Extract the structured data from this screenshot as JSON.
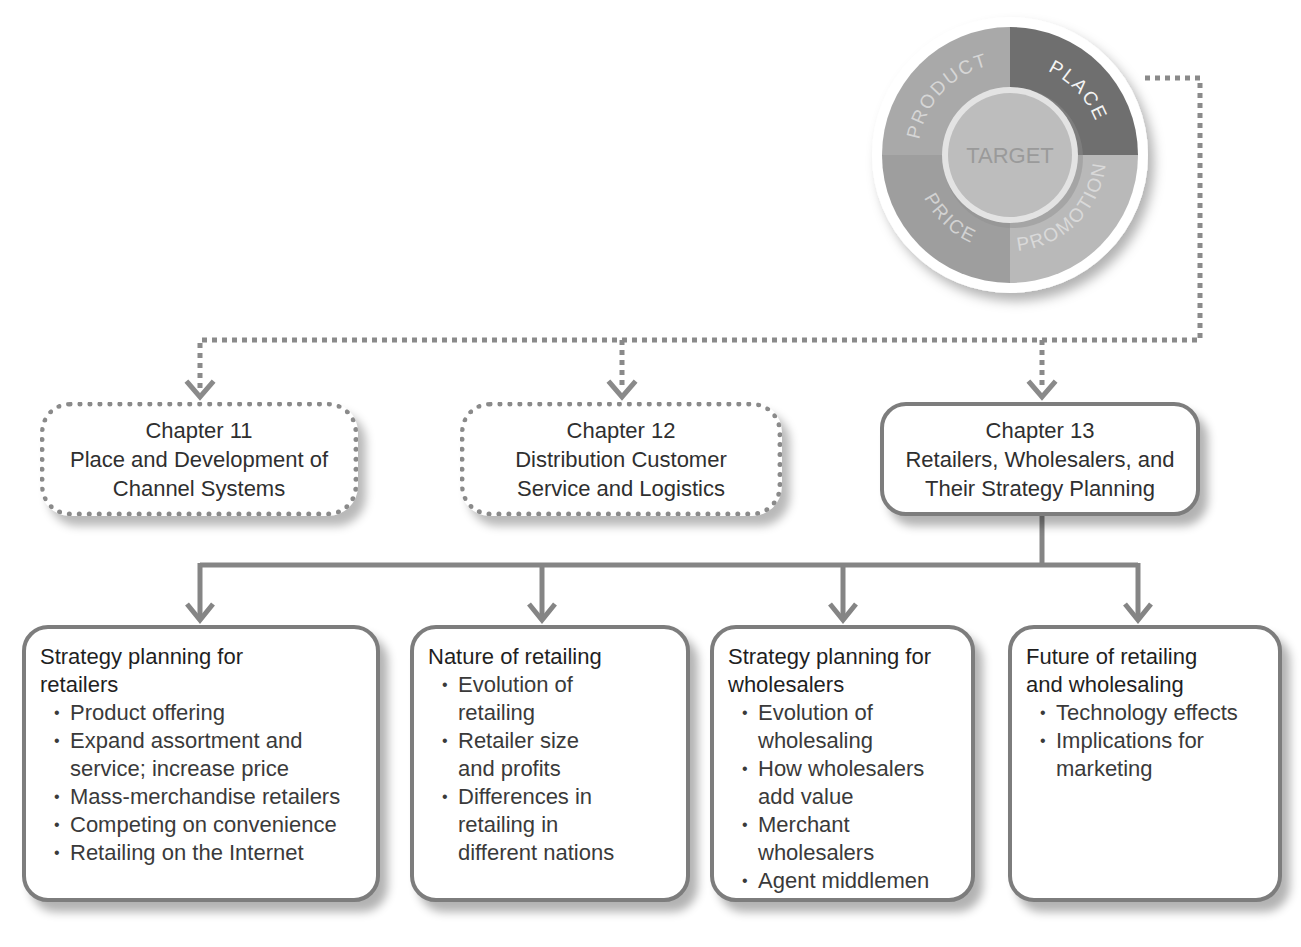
{
  "wheel": {
    "center_label": "TARGET",
    "segments": [
      {
        "label": "PRODUCT",
        "color": "#a9a9a9",
        "highlighted": false
      },
      {
        "label": "PLACE",
        "color": "#6f6f6f",
        "highlighted": true
      },
      {
        "label": "PROMOTION",
        "color": "#b7b7b7",
        "highlighted": false
      },
      {
        "label": "PRICE",
        "color": "#9c9c9c",
        "highlighted": false
      }
    ],
    "center_color": "#bdbdbd",
    "rim_color": "#ffffff"
  },
  "chapters": [
    {
      "number": "Chapter 11",
      "title_lines": [
        "Place and Development of",
        "Channel Systems"
      ],
      "style": "dotted"
    },
    {
      "number": "Chapter 12",
      "title_lines": [
        "Distribution Customer",
        "Service and Logistics"
      ],
      "style": "dotted"
    },
    {
      "number": "Chapter 13",
      "title_lines": [
        "Retailers, Wholesalers, and",
        "Their Strategy Planning"
      ],
      "style": "solid"
    }
  ],
  "topics": [
    {
      "title_lines": [
        "Strategy planning for",
        "retailers"
      ],
      "bullets": [
        [
          "Product offering"
        ],
        [
          "Expand assortment and",
          "service; increase price"
        ],
        [
          "Mass-merchandise retailers"
        ],
        [
          "Competing on convenience"
        ],
        [
          "Retailing on the Internet"
        ]
      ]
    },
    {
      "title_lines": [
        "Nature of retailing"
      ],
      "bullets": [
        [
          "Evolution of",
          "retailing"
        ],
        [
          "Retailer size",
          "and profits"
        ],
        [
          "Differences in",
          "retailing in",
          "different nations"
        ]
      ]
    },
    {
      "title_lines": [
        "Strategy planning for",
        "wholesalers"
      ],
      "bullets": [
        [
          "Evolution of",
          "wholesaling"
        ],
        [
          "How wholesalers",
          "add value"
        ],
        [
          "Merchant",
          "wholesalers"
        ],
        [
          "Agent middlemen"
        ]
      ]
    },
    {
      "title_lines": [
        "Future of retailing",
        "and wholesaling"
      ],
      "bullets": [
        [
          "Technology effects"
        ],
        [
          "Implications for",
          "marketing"
        ]
      ]
    }
  ],
  "colors": {
    "connector": "#8a8a8a",
    "box_border": "#7d7d7d",
    "text": "#2b2b2b"
  }
}
